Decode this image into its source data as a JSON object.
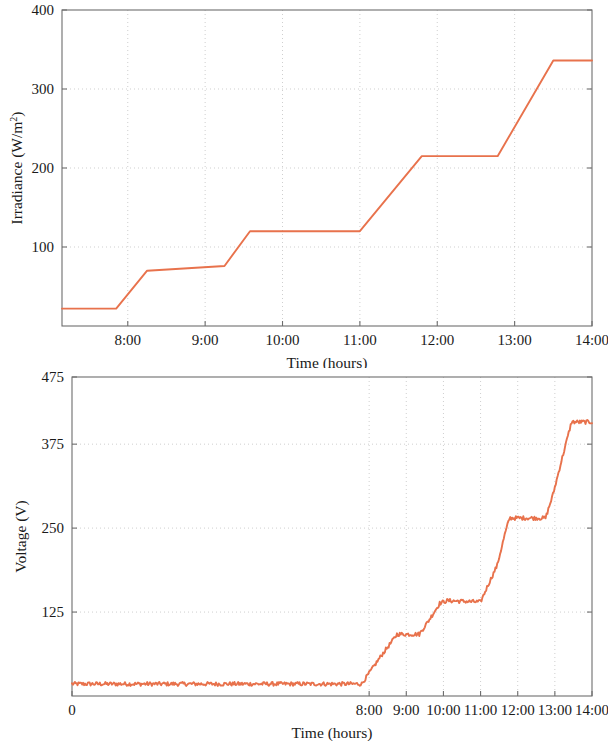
{
  "figure": {
    "background_color": "#ffffff",
    "line_color": "#e8724c",
    "axis_color": "#6d6d6d",
    "grid_color": "#c9c9c9"
  },
  "chart_data": [
    {
      "type": "line",
      "id": "irradiance-vs-time",
      "title": "",
      "xlabel": "Time (hours)",
      "ylabel": "Irradiance (W/m2)",
      "ylabel_display": "Irradiance (W/m",
      "ylabel_superscript": "2",
      "ylabel_suffix": ")",
      "xlim": [
        7.15,
        14.0
      ],
      "ylim": [
        0,
        400
      ],
      "xticks": [
        8,
        9,
        10,
        11,
        12,
        13,
        14
      ],
      "xticklabels": [
        "8:00",
        "9:00",
        "10:00",
        "11:00",
        "12:00",
        "13:00",
        "14:00"
      ],
      "yticks": [
        100,
        200,
        300,
        400
      ],
      "yticklabels": [
        "100",
        "200",
        "300",
        "400"
      ],
      "grid": true,
      "legend": "none",
      "series": [
        {
          "name": "Irradiance",
          "color": "#e8724c",
          "x": [
            7.15,
            7.85,
            8.25,
            9.25,
            9.58,
            11.0,
            11.8,
            12.78,
            13.5,
            14.0
          ],
          "y": [
            22,
            22,
            70,
            76,
            120,
            120,
            215,
            215,
            336,
            336
          ]
        }
      ],
      "annotations": [
        "Irradiance rises in four steps: ~22 W/m2 before 7:51, ~70-76 W/m2 from 8:15 to 9:15, ~120 W/m2 from 9:35 to 11:00, ~215 W/m2 from 11:48 to 12:47, ~336 W/m2 after 13:30"
      ]
    },
    {
      "type": "line",
      "id": "voltage-vs-time",
      "title": "",
      "xlabel": "Time (hours)",
      "ylabel": "Voltage (V)",
      "xlim": [
        0,
        14.0
      ],
      "ylim": [
        0,
        475
      ],
      "xticks": [
        0,
        8,
        9,
        10,
        11,
        12,
        13,
        14
      ],
      "xticklabels": [
        "0",
        "8:00",
        "9:00",
        "10:00",
        "11:00",
        "12:00",
        "13:00",
        "14:00"
      ],
      "yticks": [
        125,
        250,
        375,
        475
      ],
      "yticklabels": [
        "125",
        "250",
        "375",
        "475"
      ],
      "grid": true,
      "legend": "none",
      "series": [
        {
          "name": "Voltage",
          "color": "#e8724c",
          "noise_amplitude": 3,
          "x": [
            0,
            7.8,
            8.05,
            8.35,
            8.6,
            8.75,
            9.35,
            9.6,
            9.9,
            10.1,
            11.0,
            11.2,
            11.45,
            11.65,
            11.78,
            12.75,
            12.95,
            13.2,
            13.45,
            14.0
          ],
          "y": [
            18,
            18,
            38,
            62,
            80,
            92,
            92,
            112,
            138,
            142,
            140,
            165,
            195,
            240,
            265,
            265,
            300,
            355,
            408,
            408
          ]
        }
      ],
      "annotations": [
        "Voltage tracks irradiance with noisy plateaus: ~18 V until 7:48, ~92 V from 8:45 to 9:21, ~140 V from 10:06 to 11:00, ~265 V from 11:47 to 12:45, ~408 V after 13:27"
      ]
    }
  ]
}
